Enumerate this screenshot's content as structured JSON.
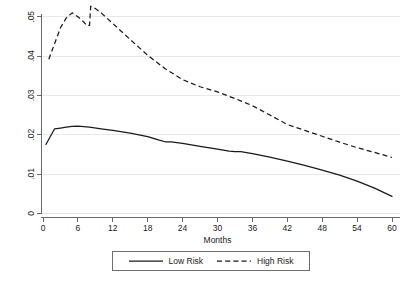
{
  "chart_data": {
    "type": "line",
    "title": "",
    "subtitle": "",
    "xlabel": "Months",
    "ylabel": "",
    "xlim": [
      0,
      60
    ],
    "ylim": [
      0,
      0.0555
    ],
    "xticks": [
      0,
      6,
      12,
      18,
      24,
      30,
      36,
      42,
      48,
      54,
      60
    ],
    "xticklabels": [
      "0",
      "6",
      "12",
      "18",
      "24",
      "30",
      "36",
      "42",
      "48",
      "54",
      "60"
    ],
    "yticks": [
      0,
      0.01,
      0.02,
      0.03,
      0.04,
      0.05
    ],
    "yticklabels": [
      "0",
      ".01",
      ".02",
      ".03",
      ".04",
      ".05"
    ],
    "grid": "horizontal",
    "grid_color": "#e8e8e8",
    "background": "#ffffff",
    "legend_position": "bottom-center",
    "series": [
      {
        "name": "Low Risk",
        "style": "solid",
        "color": "#1a1a1a",
        "x": [
          0.5,
          2,
          3,
          4,
          5,
          6,
          8,
          10,
          12,
          15,
          18,
          20,
          21,
          22,
          24,
          27,
          30,
          32,
          33,
          34,
          36,
          39,
          42,
          45,
          48,
          51,
          54,
          57,
          60
        ],
        "values": [
          0.0175,
          0.0215,
          0.0217,
          0.0219,
          0.0221,
          0.0222,
          0.0219,
          0.0215,
          0.0211,
          0.0204,
          0.0195,
          0.0186,
          0.0182,
          0.0182,
          0.0178,
          0.017,
          0.0163,
          0.0158,
          0.0157,
          0.0157,
          0.0152,
          0.0143,
          0.0133,
          0.0122,
          0.011,
          0.0097,
          0.0082,
          0.0064,
          0.0043
        ]
      },
      {
        "name": "High Risk",
        "style": "dashed",
        "color": "#1a1a1a",
        "x": [
          1,
          2,
          3,
          4,
          5,
          6,
          7,
          7.5,
          8,
          8.2,
          9,
          10,
          12,
          15,
          18,
          21,
          24,
          27,
          30,
          33,
          36,
          39,
          42,
          45,
          48,
          51,
          54,
          57,
          60
        ],
        "values": [
          0.0392,
          0.0432,
          0.0472,
          0.0497,
          0.051,
          0.05,
          0.0487,
          0.0478,
          0.0478,
          0.0527,
          0.0521,
          0.051,
          0.0483,
          0.0442,
          0.0402,
          0.0368,
          0.034,
          0.0322,
          0.0309,
          0.0292,
          0.0274,
          0.025,
          0.0226,
          0.0211,
          0.0196,
          0.0181,
          0.0167,
          0.0155,
          0.0142
        ]
      }
    ]
  },
  "legend": {
    "entries": [
      {
        "label": "Low Risk",
        "style": "solid"
      },
      {
        "label": "High Risk",
        "style": "dashed"
      }
    ]
  },
  "axes": {
    "x_title": "Months"
  }
}
